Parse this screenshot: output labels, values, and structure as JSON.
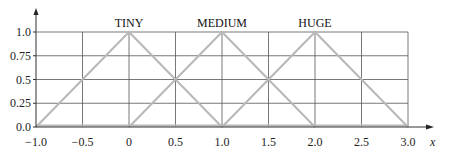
{
  "chart_data": {
    "type": "line",
    "title": "",
    "xlabel": "x",
    "ylabel": "",
    "xlim": [
      -1.0,
      3.0
    ],
    "ylim": [
      0.0,
      1.0
    ],
    "grid": true,
    "legend": null,
    "x_ticks": [
      "−1.0",
      "−0.5",
      "0",
      "0.5",
      "1.0",
      "1.5",
      "2.0",
      "2.5",
      "3.0"
    ],
    "x_tick_values": [
      -1.0,
      -0.5,
      0,
      0.5,
      1.0,
      1.5,
      2.0,
      2.5,
      3.0
    ],
    "y_ticks": [
      "0.0",
      "0.25",
      "0.5",
      "0.75",
      "1.0"
    ],
    "y_tick_values": [
      0.0,
      0.25,
      0.5,
      0.75,
      1.0
    ],
    "series": [
      {
        "name": "TINY",
        "x": [
          -1.0,
          0.0,
          1.0
        ],
        "y": [
          0.0,
          1.0,
          0.0
        ]
      },
      {
        "name": "MEDIUM",
        "x": [
          0.0,
          1.0,
          2.0
        ],
        "y": [
          0.0,
          1.0,
          0.0
        ]
      },
      {
        "name": "HUGE",
        "x": [
          1.0,
          2.0,
          3.0
        ],
        "y": [
          0.0,
          1.0,
          0.0
        ]
      }
    ],
    "annotations": [
      "TINY",
      "MEDIUM",
      "HUGE"
    ]
  },
  "style": {
    "grid_color": "#555555",
    "series_color": "#b8b8b8",
    "axis_color": "#333333"
  }
}
